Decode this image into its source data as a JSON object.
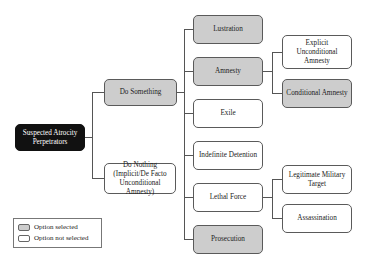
{
  "diagram": {
    "root": {
      "label": "Suspected Atrocity Perpetrators"
    },
    "level1": [
      {
        "label": "Do Something",
        "selected": true
      },
      {
        "label": "Do Nothing (Implicit/De Facto Unconditional Amnesty)",
        "selected": false
      }
    ],
    "level2": [
      {
        "label": "Lustration",
        "selected": true
      },
      {
        "label": "Amnesty",
        "selected": true
      },
      {
        "label": "Exile",
        "selected": false
      },
      {
        "label": "Indefinite Detention",
        "selected": false
      },
      {
        "label": "Lethal Force",
        "selected": false
      },
      {
        "label": "Prosecution",
        "selected": true
      }
    ],
    "level3_amnesty": [
      {
        "label": "Explicit Unconditional Amnesty",
        "selected": false
      },
      {
        "label": "Conditional Amnesty",
        "selected": true
      }
    ],
    "level3_lethal": [
      {
        "label": "Legitimate Military Target",
        "selected": false
      },
      {
        "label": "Assassination",
        "selected": false
      }
    ]
  },
  "legend": {
    "selected_label": "Option selected",
    "not_selected_label": "Option not selected"
  },
  "colors": {
    "selected_fill": "#cdcdcd",
    "root_fill": "#111111",
    "border": "#5a5a5a"
  }
}
